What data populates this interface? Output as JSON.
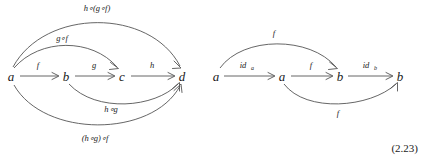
{
  "figure": {
    "equation_number": "(2.23)",
    "left_diagram": {
      "name": "associativity-diagram",
      "nodes": [
        {
          "id": "a",
          "label": "a",
          "x": 11,
          "y": 76
        },
        {
          "id": "b",
          "label": "b",
          "x": 66,
          "y": 76
        },
        {
          "id": "c",
          "label": "c",
          "x": 122,
          "y": 76
        },
        {
          "id": "d",
          "label": "d",
          "x": 182,
          "y": 76
        }
      ],
      "edges": [
        {
          "id": "f",
          "label": "f",
          "from": "a",
          "to": "b",
          "label_x": 38,
          "label_y": 68
        },
        {
          "id": "g",
          "label": "g",
          "from": "b",
          "to": "c",
          "label_x": 94,
          "label_y": 68
        },
        {
          "id": "h",
          "label": "h",
          "from": "c",
          "to": "d",
          "label_x": 152,
          "label_y": 68
        },
        {
          "id": "gf",
          "label": "g∘f",
          "from": "a",
          "to": "c",
          "label_x": 62,
          "label_y": 41
        },
        {
          "id": "hgf",
          "label": "h∘(g∘f)",
          "from": "a",
          "to": "d",
          "label_x": 97,
          "label_y": 11
        },
        {
          "id": "hg",
          "label": "h∘g",
          "from": "b",
          "to": "d",
          "label_x": 111,
          "label_y": 112
        },
        {
          "id": "hg_f",
          "label": "(h∘g)∘f",
          "from": "a",
          "to": "d",
          "label_x": 95,
          "label_y": 141
        }
      ]
    },
    "right_diagram": {
      "name": "identity-diagram",
      "nodes": [
        {
          "id": "a1",
          "label": "a",
          "x": 216,
          "y": 76
        },
        {
          "id": "a2",
          "label": "a",
          "x": 282,
          "y": 76
        },
        {
          "id": "b1",
          "label": "b",
          "x": 340,
          "y": 76
        },
        {
          "id": "b2",
          "label": "b",
          "x": 400,
          "y": 76
        }
      ],
      "edges": [
        {
          "id": "id_a",
          "label": "id",
          "sub": "a",
          "from": "a1",
          "to": "a2",
          "label_x": 243,
          "label_y": 68
        },
        {
          "id": "f_mid",
          "label": "f",
          "from": "a2",
          "to": "b1",
          "label_x": 311,
          "label_y": 68
        },
        {
          "id": "id_b",
          "label": "id",
          "sub": "b",
          "from": "b1",
          "to": "b2",
          "label_x": 366,
          "label_y": 68
        },
        {
          "id": "f_top",
          "label": "f",
          "from": "a1",
          "to": "b1",
          "label_x": 274,
          "label_y": 36
        },
        {
          "id": "f_bottom",
          "label": "f",
          "from": "a2",
          "to": "b2",
          "label_x": 338,
          "label_y": 116
        }
      ]
    },
    "colors": {
      "stroke": "#555555",
      "text": "#1a1a1a",
      "background": "#ffffff"
    }
  }
}
